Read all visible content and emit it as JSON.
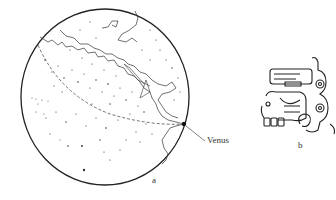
{
  "figure": {
    "panels": [
      {
        "id": "a",
        "label": "a",
        "description": "Sky map of stars with coastline and dashed ecliptic path",
        "annotation": "Venus"
      },
      {
        "id": "b",
        "label": "b",
        "description": "Maya glyph"
      }
    ]
  },
  "colors": {
    "ink": "#222222",
    "background": "#ffffff"
  }
}
